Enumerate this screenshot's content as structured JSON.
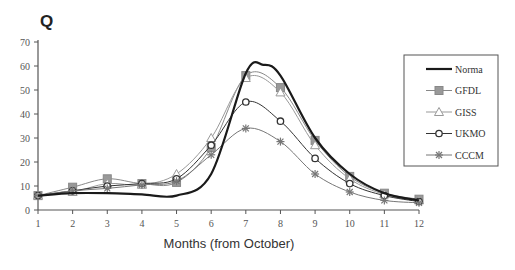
{
  "chart_data": {
    "type": "line",
    "title": "Q",
    "xlabel": "Months (from October)",
    "ylabel": "",
    "x": [
      1,
      2,
      3,
      4,
      5,
      6,
      7,
      8,
      9,
      10,
      11,
      12
    ],
    "xlim": [
      1,
      12
    ],
    "ylim": [
      0,
      70
    ],
    "yticks": [
      0,
      10,
      20,
      30,
      40,
      50,
      60,
      70
    ],
    "grid": false,
    "legend_position": "right",
    "series": [
      {
        "name": "Norma",
        "marker": "none",
        "color": "#1a1a1a",
        "width": 2.2,
        "values": [
          6,
          7,
          7,
          6.5,
          6,
          15,
          57,
          56,
          30,
          15,
          7,
          4
        ],
        "peak": {
          "x": 7.5,
          "y": 60.5
        }
      },
      {
        "name": "GFDL",
        "marker": "square",
        "color": "#888888",
        "width": 1,
        "values": [
          6,
          9.5,
          13,
          11,
          11.5,
          26,
          56,
          51,
          29,
          14,
          7,
          4.5
        ]
      },
      {
        "name": "GISS",
        "marker": "triangle",
        "color": "#999999",
        "width": 1,
        "values": [
          6,
          7.5,
          11,
          10.5,
          15,
          30,
          55,
          49,
          27,
          13,
          6.5,
          4
        ]
      },
      {
        "name": "UKMO",
        "marker": "diamond",
        "color": "#333333",
        "width": 1,
        "values": [
          6,
          8,
          10,
          11,
          13,
          27,
          45,
          37,
          21.5,
          11,
          6,
          3.5
        ]
      },
      {
        "name": "CCCM",
        "marker": "asterisk",
        "color": "#777777",
        "width": 1,
        "values": [
          6,
          8,
          9,
          10.5,
          12,
          23,
          34,
          28.5,
          15,
          7.5,
          4,
          3
        ]
      }
    ]
  }
}
